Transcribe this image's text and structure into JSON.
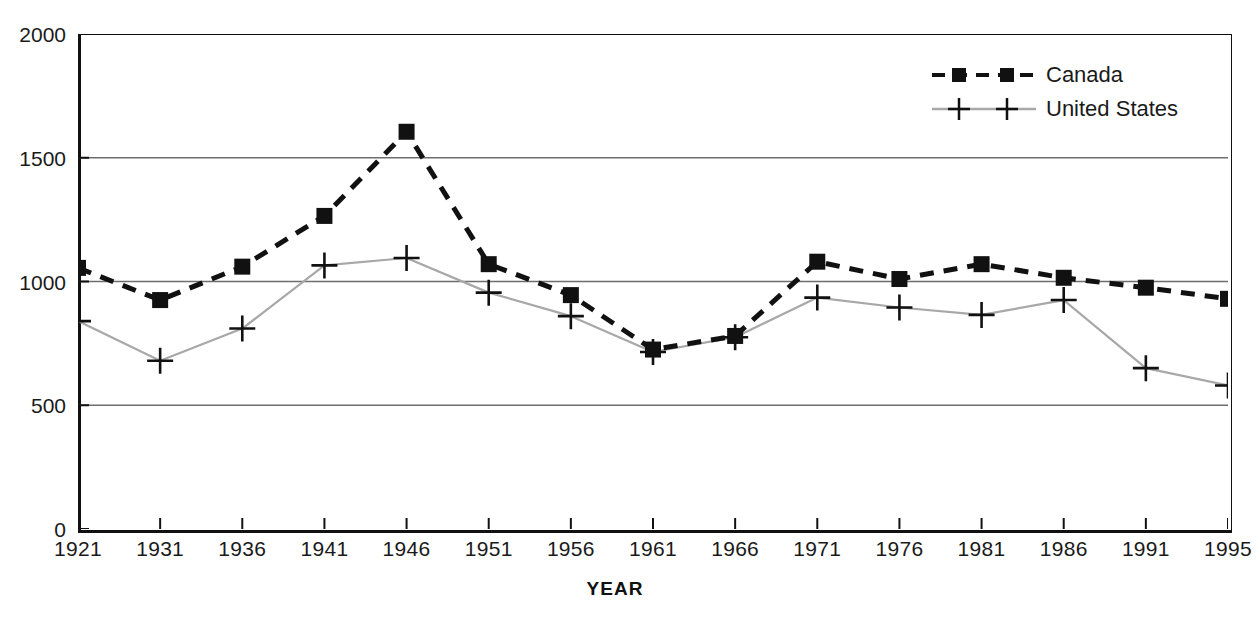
{
  "chart_data": {
    "type": "line",
    "title": "",
    "xlabel": "YEAR",
    "ylabel": "",
    "grid": true,
    "legend_position": "top-right",
    "categories": [
      "1921",
      "1931",
      "1936",
      "1941",
      "1946",
      "1951",
      "1956",
      "1961",
      "1966",
      "1971",
      "1976",
      "1981",
      "1986",
      "1991",
      "1995"
    ],
    "x": [
      1921,
      1931,
      1936,
      1941,
      1946,
      1951,
      1956,
      1961,
      1966,
      1971,
      1976,
      1981,
      1986,
      1991,
      1995
    ],
    "ylim": [
      0,
      2000
    ],
    "yticks": [
      0,
      500,
      1000,
      1500,
      2000
    ],
    "ytick_labels": [
      "0",
      "500",
      "1000",
      "1500",
      "2000"
    ],
    "series": [
      {
        "name": "Canada",
        "marker": "filled-square",
        "line_style": "dashed",
        "color": "#111111",
        "values": [
          1055,
          925,
          1060,
          1265,
          1605,
          1070,
          945,
          725,
          780,
          1080,
          1010,
          1070,
          1015,
          975,
          930
        ]
      },
      {
        "name": "United States",
        "marker": "plus",
        "line_style": "solid",
        "color": "#a8a8a8",
        "values": [
          840,
          680,
          810,
          1065,
          1095,
          955,
          860,
          715,
          775,
          935,
          895,
          865,
          925,
          650,
          580
        ]
      }
    ]
  },
  "legend": {
    "items": [
      {
        "label": "Canada"
      },
      {
        "label": "United States"
      }
    ]
  },
  "axes": {
    "x_title": "YEAR"
  },
  "colors": {
    "canada_line": "#111111",
    "us_line": "#a8a8a8",
    "grid": "#6e6e6e",
    "axis": "#111111",
    "background": "#ffffff"
  }
}
